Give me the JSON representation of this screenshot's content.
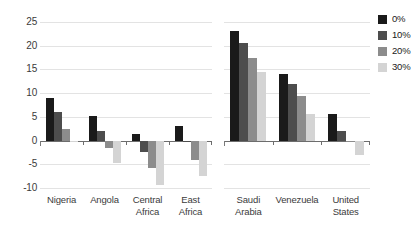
{
  "chart_data": {
    "type": "bar",
    "title": "",
    "subtitle": "",
    "xlabel": "",
    "ylabel": "Dollars per barrel",
    "ylim": [
      -10,
      25
    ],
    "yticks": [
      25,
      20,
      15,
      10,
      5,
      0,
      -5,
      -10
    ],
    "ytick_labels": [
      "25",
      "20",
      "15",
      "10",
      "5",
      "0",
      "-5",
      "-10"
    ],
    "grid": true,
    "legend_position": "right",
    "legend_title": "",
    "orientation": "vertical",
    "grouped": true,
    "panels": [
      {
        "name": "left-panel",
        "categories": [
          "Nigeria",
          "Angola",
          "Central Africa",
          "East Africa"
        ],
        "category_lines": [
          [
            "Nigeria"
          ],
          [
            "Angola"
          ],
          [
            "Central",
            "Africa"
          ],
          [
            "East",
            "Africa"
          ]
        ],
        "series": [
          {
            "name": "0%",
            "values": [
              9.0,
              5.2,
              1.3,
              3.0
            ]
          },
          {
            "name": "10%",
            "values": [
              6.0,
              2.0,
              -2.5,
              -0.3
            ]
          },
          {
            "name": "20%",
            "values": [
              2.5,
              -1.5,
              -5.7,
              -4.0
            ]
          },
          {
            "name": "30%",
            "values": [
              -0.3,
              -4.7,
              -9.3,
              -7.5
            ]
          }
        ]
      },
      {
        "name": "right-panel",
        "categories": [
          "Saudi Arabia",
          "Venezuela",
          "United States"
        ],
        "category_lines": [
          [
            "Saudi",
            "Arabia"
          ],
          [
            "Venezuela"
          ],
          [
            "United",
            "States"
          ]
        ],
        "series": [
          {
            "name": "0%",
            "values": [
              23.0,
              14.0,
              5.5
            ]
          },
          {
            "name": "10%",
            "values": [
              20.5,
              12.0,
              2.0
            ]
          },
          {
            "name": "20%",
            "values": [
              17.5,
              9.5,
              -0.3
            ]
          },
          {
            "name": "30%",
            "values": [
              14.5,
              5.5,
              -3.0
            ]
          }
        ]
      }
    ],
    "series_colors": [
      "#1a1a1a",
      "#4d4d4d",
      "#8c8c8c",
      "#d4d4d4"
    ],
    "legend": [
      {
        "label": "0%",
        "color": "#1a1a1a"
      },
      {
        "label": "10%",
        "color": "#4d4d4d"
      },
      {
        "label": "20%",
        "color": "#8c8c8c"
      },
      {
        "label": "30%",
        "color": "#d4d4d4"
      }
    ],
    "colors": {
      "gridline": "#e3e3e3",
      "axis": "#6d6d6d",
      "text": "#3b3b3b",
      "background": "#ffffff"
    }
  }
}
